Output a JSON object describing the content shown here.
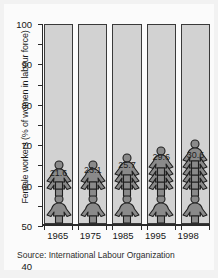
{
  "chart_data": {
    "type": "bar",
    "title": "",
    "subtitle": "",
    "xlabel": "",
    "ylabel": "Female workers (% of women in labour force)",
    "categories": [
      "1965",
      "1975",
      "1985",
      "1995",
      "1998"
    ],
    "values": [
      21.6,
      23.1,
      25.7,
      29.6,
      30.6
    ],
    "value_labels": [
      "21.6",
      "23.1",
      "25.7",
      "29.6",
      "30.6"
    ],
    "ylim": [
      0,
      100
    ],
    "ytick_labels": [
      "0",
      "10",
      "20",
      "30",
      "40",
      "50",
      "60",
      "70",
      "80",
      "90",
      "100"
    ],
    "ytick_values": [
      0,
      10,
      20,
      30,
      40,
      50,
      60,
      70,
      80,
      90,
      100
    ],
    "grid": false,
    "legend": null,
    "legend_position": "none",
    "annotations": [
      "Source: International Labour Organization"
    ],
    "marker_style": "stacked-female-pictogram",
    "series": [
      {
        "name": "Female workers (% of women in labour force)",
        "values": [
          21.6,
          23.1,
          25.7,
          29.6,
          30.6
        ]
      }
    ]
  },
  "source_note": "Source: International Labour Organization",
  "colors": {
    "column_fill": "#d2d2d2",
    "column_border": "#3a3a3a",
    "figure_fill": "#8a8a8a",
    "figure_outline": "#1f1f1f",
    "axis": "#2a2a2a",
    "text": "#161616",
    "page_background": "#f2f2f2",
    "card_background": "#fbfbfb"
  },
  "icons": {
    "pictogram": "female-figure-icon"
  }
}
